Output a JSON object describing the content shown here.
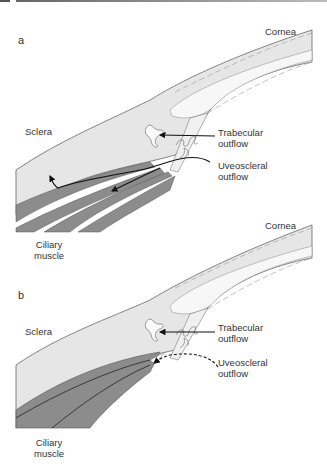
{
  "figure": {
    "panels": [
      {
        "letter": "a",
        "labels": {
          "cornea": "Cornea",
          "sclera": "Sclera",
          "trabecular_line1": "Trabecular",
          "trabecular_line2": "outflow",
          "uveoscleral_line1": "Uveoscleral",
          "uveoscleral_line2": "outflow",
          "ciliary_line1": "Ciliary",
          "ciliary_line2": "muscle"
        },
        "uveoscleral_arrow_style": "solid"
      },
      {
        "letter": "b",
        "labels": {
          "cornea": "Cornea",
          "sclera": "Sclera",
          "trabecular_line1": "Trabecular",
          "trabecular_line2": "outflow",
          "uveoscleral_line1": "Uveoscleral",
          "uveoscleral_line2": "outflow",
          "ciliary_line1": "Ciliary",
          "ciliary_line2": "muscle"
        },
        "uveoscleral_arrow_style": "dashed"
      }
    ],
    "colors": {
      "sclera_fill": "#e6e6e6",
      "muscle_fill": "#8c8c8c",
      "outline": "#555555",
      "arrow": "#111111",
      "background": "#ffffff"
    }
  }
}
